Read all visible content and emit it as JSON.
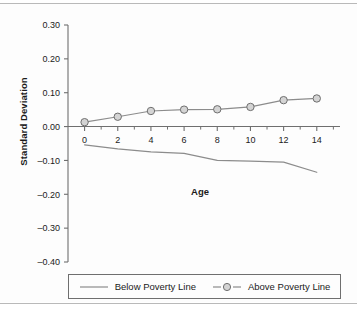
{
  "chart_data": {
    "type": "line",
    "title": "",
    "xlabel": "Age",
    "ylabel": "Standard Deviation",
    "x": [
      0,
      2,
      4,
      6,
      8,
      10,
      12,
      14
    ],
    "xlim": [
      -1,
      15.4
    ],
    "ylim": [
      -0.4,
      0.3
    ],
    "xticks": [
      "0",
      "2",
      "4",
      "6",
      "8",
      "10",
      "12",
      "14"
    ],
    "yticks": [
      "0.30",
      "0.20",
      "0.10",
      "0.00",
      "–0.10",
      "–0.20",
      "–0.30",
      "–0.40"
    ],
    "ytick_values": [
      0.3,
      0.2,
      0.1,
      0.0,
      -0.1,
      -0.2,
      -0.3,
      -0.4
    ],
    "grid": false,
    "legend_position": "bottom",
    "series": [
      {
        "name": "Below Poverty Line",
        "marker": "none",
        "color": "#8c8c8c",
        "values": [
          -0.054,
          -0.066,
          -0.075,
          -0.079,
          -0.1,
          -0.102,
          -0.105,
          -0.135
        ],
        "x": [
          0,
          2,
          4,
          6,
          8,
          10,
          12,
          14
        ]
      },
      {
        "name": "Above Poverty Line",
        "marker": "circle",
        "color": "#8c8c8c",
        "marker_fill": "#d4d4d4",
        "marker_edge": "#6f6f6f",
        "values": [
          0.013,
          0.029,
          0.046,
          0.05,
          0.051,
          0.058,
          0.078,
          0.083
        ],
        "x": [
          0,
          2,
          4,
          6,
          8,
          10,
          12,
          14
        ]
      }
    ]
  },
  "legend": {
    "items": [
      {
        "label": "Below Poverty Line",
        "style": "line"
      },
      {
        "label": "Above Poverty Line",
        "style": "line-marker"
      }
    ]
  },
  "colors": {
    "axis": "#6f6f6f",
    "text": "#1b1b1b",
    "line": "#8c8c8c",
    "marker_fill": "#d4d4d4",
    "marker_edge": "#6f6f6f",
    "background": "#fdfdfd",
    "rule": "#b9b9b9"
  }
}
